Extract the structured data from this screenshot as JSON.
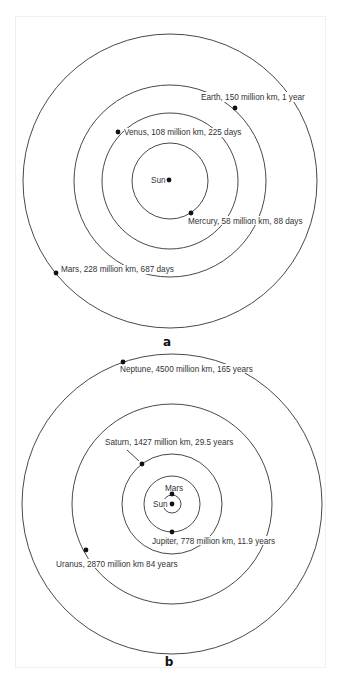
{
  "diagrams": [
    {
      "caption": "a",
      "center_label": "Sun",
      "planets": [
        {
          "name": "Mercury",
          "distance": "58 million km",
          "period": "88 days",
          "label": "Mercury, 58 million km, 88 days"
        },
        {
          "name": "Venus",
          "distance": "108 million km",
          "period": "225 days",
          "label": "Venus, 108 million km, 225 days"
        },
        {
          "name": "Earth",
          "distance": "150 million km",
          "period": "1 year",
          "label": "Earth, 150 million km, 1 year"
        },
        {
          "name": "Mars",
          "distance": "228 million km",
          "period": "687 days",
          "label": "Mars, 228 million km, 687 days"
        }
      ]
    },
    {
      "caption": "b",
      "center_label": "Sun",
      "planets": [
        {
          "name": "Mars",
          "label": "Mars"
        },
        {
          "name": "Jupiter",
          "distance": "778 million km",
          "period": "11.9 years",
          "label": "Jupiter, 778 million km, 11.9 years"
        },
        {
          "name": "Saturn",
          "distance": "1427 million km",
          "period": "29.5 years",
          "label": "Saturn, 1427 million km, 29.5 years"
        },
        {
          "name": "Uranus",
          "distance": "2870 million km",
          "period": "84 years",
          "label": "Uranus, 2870 million km 84 years"
        },
        {
          "name": "Neptune",
          "distance": "4500 million km",
          "period": "165 years",
          "label": "Neptune, 4500 million km, 165 years"
        }
      ]
    }
  ]
}
